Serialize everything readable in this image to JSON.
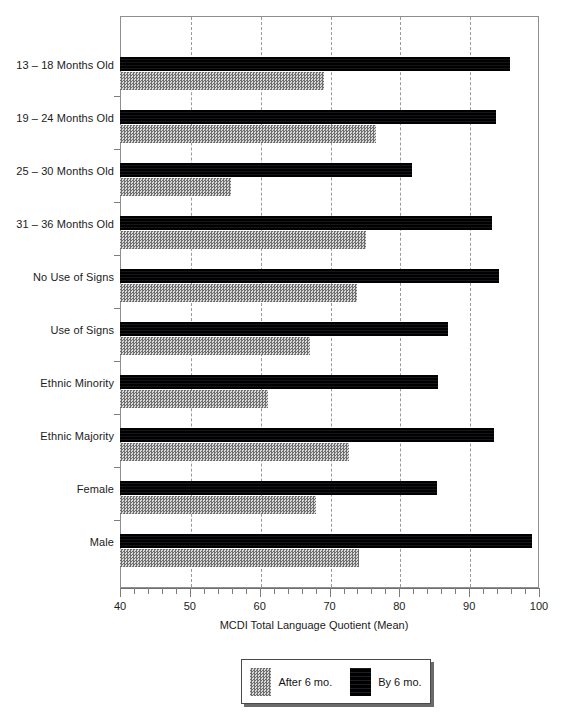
{
  "chart_data": {
    "type": "bar",
    "orientation": "horizontal",
    "title": "",
    "xlabel": "MCDI Total Language Quotient (Mean)",
    "ylabel": "",
    "xlim": [
      40,
      100
    ],
    "ylim": null,
    "grid": "vertical-dashed-major",
    "major_tick_step": 10,
    "minor_tick_step": 2,
    "xticks": [
      40,
      50,
      60,
      70,
      80,
      90,
      100
    ],
    "xticklabels": [
      "40",
      "50",
      "60",
      "70",
      "80",
      "90",
      "100"
    ],
    "legend_position": "below-center",
    "categories": [
      "13 – 18 Months Old",
      "19 – 24 Months Old",
      "25 – 30 Months Old",
      "31 – 36 Months Old",
      "No Use of Signs",
      "Use of Signs",
      "Ethnic Minority",
      "Ethnic Majority",
      "Female",
      "Male"
    ],
    "series": [
      {
        "name": "By 6 mo.",
        "color": "#0a0a0a",
        "values": [
          95.8,
          93.9,
          81.8,
          93.2,
          94.3,
          87.0,
          85.6,
          93.5,
          85.4,
          99.0
        ]
      },
      {
        "name": "After 6 mo.",
        "color": "#808080",
        "values": [
          69.2,
          76.6,
          55.9,
          75.2,
          74.0,
          67.2,
          61.2,
          72.8,
          68.0,
          74.2
        ]
      }
    ]
  },
  "legend": {
    "entries": [
      {
        "label": "After 6 mo.",
        "swatch": "gray-dither-swatch"
      },
      {
        "label": "By 6 mo.",
        "swatch": "black-swatch"
      }
    ]
  },
  "axis": {
    "x_title": "MCDI Total Language Quotient (Mean)"
  }
}
